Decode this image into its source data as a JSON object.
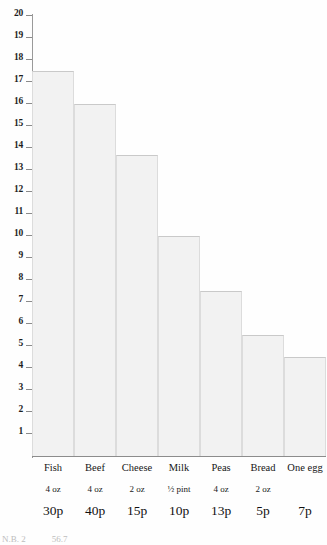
{
  "chart_data": {
    "type": "bar",
    "title": "",
    "subtitle": "",
    "xlabel": "",
    "ylabel": "",
    "ylim": [
      0,
      20
    ],
    "ytick_step": 1,
    "grid": false,
    "legend": null,
    "categories": [
      "Fish",
      "Beef",
      "Cheese",
      "Milk",
      "Peas",
      "Bread",
      "One egg"
    ],
    "values": [
      17.5,
      16,
      13.7,
      10,
      7.5,
      5.5,
      4.5
    ],
    "ytick_labels": [
      "20",
      "19",
      "18",
      "17",
      "16",
      "15",
      "14",
      "13",
      "12",
      "11",
      "10",
      "9",
      "8",
      "7",
      "6",
      "5",
      "4",
      "3",
      "2",
      "1"
    ],
    "ytick_values": [
      20,
      19,
      18,
      17,
      16,
      15,
      14,
      13,
      12,
      11,
      10,
      9,
      8,
      7,
      6,
      5,
      4,
      3,
      2,
      1
    ],
    "quantities": [
      "4 oz",
      "4 oz",
      "2 oz",
      "½ pint",
      "4 oz",
      "2 oz",
      ""
    ],
    "prices": [
      "30p",
      "40p",
      "15p",
      "10p",
      "13p",
      "5p",
      "7p"
    ],
    "bar_color": "#f2f2f2",
    "bar_edge_color": "#c9c9c9",
    "axis_color": "#8c8c8c",
    "text_color": "#161616",
    "background_color": "#fefefe"
  },
  "footnote": {
    "left_fragment": "N.B. 2",
    "right_fragment": "56.7"
  }
}
